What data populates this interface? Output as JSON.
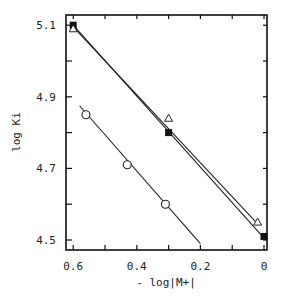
{
  "chart_data": {
    "type": "line",
    "title": "",
    "xlabel": "- log|M+|",
    "ylabel": "log Ki",
    "xlim": [
      0.62,
      -0.01
    ],
    "ylim": [
      4.49,
      5.14
    ],
    "x_inverted": true,
    "grid": false,
    "legend": null,
    "x_ticks": [
      0.6,
      0.5,
      0.4,
      0.3,
      0.2,
      0.1,
      0
    ],
    "x_tick_labels": [
      "0.6",
      "0.4",
      "0.2",
      "0"
    ],
    "y_ticks": [
      4.5,
      4.6,
      4.7,
      4.8,
      4.9,
      5.0,
      5.1
    ],
    "y_tick_labels": [
      "4.5",
      "4.7",
      "4.9",
      "5.1"
    ],
    "series": [
      {
        "name": "filled-square",
        "marker": "filled-square",
        "points": [
          [
            0.6,
            5.1
          ],
          [
            0.3,
            4.8
          ],
          [
            0.0,
            4.51
          ]
        ],
        "fit_line": [
          [
            0.6,
            5.1
          ],
          [
            0.0,
            4.505
          ]
        ]
      },
      {
        "name": "open-triangle",
        "marker": "open-triangle",
        "points": [
          [
            0.6,
            5.09
          ],
          [
            0.3,
            4.84
          ],
          [
            0.02,
            4.55
          ]
        ],
        "fit_line": [
          [
            0.6,
            5.095
          ],
          [
            0.02,
            4.545
          ]
        ]
      },
      {
        "name": "open-circle",
        "marker": "open-circle",
        "points": [
          [
            0.56,
            4.85
          ],
          [
            0.43,
            4.71
          ],
          [
            0.31,
            4.6
          ]
        ],
        "fit_line": [
          [
            0.58,
            4.875
          ],
          [
            0.2,
            4.49
          ]
        ]
      }
    ]
  }
}
